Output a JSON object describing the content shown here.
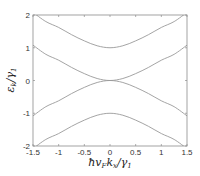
{
  "chart_data": {
    "type": "line",
    "title": "",
    "xlabel": "ħv_F k_x/γ_1",
    "ylabel": "ε_k/γ_1",
    "xlim": [
      -1.5,
      1.5
    ],
    "ylim": [
      -2,
      2
    ],
    "xticks": [
      -1.5,
      -1,
      -0.5,
      0,
      0.5,
      1,
      1.5
    ],
    "xtick_labels": [
      "-1.5",
      "-1",
      "-0.5",
      "0",
      "0.5",
      "1",
      "1.5"
    ],
    "yticks": [
      -2,
      -1,
      0,
      1,
      2
    ],
    "ytick_labels": [
      "-2",
      "-1",
      "0",
      "1",
      "2"
    ],
    "grid": false,
    "legend": null,
    "line_color": "#9a9a9a",
    "x": [
      -1.5,
      -1.25,
      -1.0,
      -0.75,
      -0.5,
      -0.25,
      0,
      0.25,
      0.5,
      0.75,
      1.0,
      1.25,
      1.5
    ],
    "series": [
      {
        "name": "upper high-energy band",
        "values": [
          2.08,
          1.8,
          1.62,
          1.4,
          1.21,
          1.06,
          1.0,
          1.06,
          1.21,
          1.4,
          1.62,
          1.8,
          2.08
        ]
      },
      {
        "name": "upper low-energy band",
        "values": [
          1.08,
          0.8,
          0.62,
          0.4,
          0.21,
          0.06,
          0.0,
          0.06,
          0.21,
          0.4,
          0.62,
          0.8,
          1.08
        ]
      },
      {
        "name": "lower low-energy band",
        "values": [
          -1.08,
          -0.8,
          -0.62,
          -0.4,
          -0.21,
          -0.06,
          0.0,
          -0.06,
          -0.21,
          -0.4,
          -0.62,
          -0.8,
          -1.08
        ]
      },
      {
        "name": "lower high-energy band",
        "values": [
          -2.08,
          -1.8,
          -1.62,
          -1.4,
          -1.21,
          -1.06,
          -1.0,
          -1.06,
          -1.21,
          -1.4,
          -1.62,
          -1.8,
          -2.08
        ]
      }
    ]
  },
  "axes": {
    "xlabel_main": "ħv",
    "xlabel_sub1": "F",
    "xlabel_mid": "k",
    "xlabel_sub2": "x",
    "xlabel_tail": "/γ",
    "xlabel_sub3": "1",
    "ylabel_main": "ε",
    "ylabel_sub1": "k",
    "ylabel_tail": "/γ",
    "ylabel_sub2": "1"
  }
}
